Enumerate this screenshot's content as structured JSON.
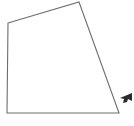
{
  "figure": {
    "name": "quadrilateral-outline-diagram",
    "background_color": "#ffffff",
    "stroke_color": "#6e6e6e",
    "fill_color": "#ffffff",
    "stroke_width": 1.1,
    "canvas": {
      "width": 134,
      "height": 126
    },
    "vertices": [
      {
        "label": "top-left",
        "x": 8,
        "y": 23
      },
      {
        "label": "top-right",
        "x": 79,
        "y": 2
      },
      {
        "label": "bottom-right",
        "x": 119,
        "y": 113
      },
      {
        "label": "bottom-left",
        "x": 7,
        "y": 113
      }
    ],
    "polygon_points": "8,23 79,2 119,113 7,113"
  },
  "cursor": {
    "name": "left-pointing-arrow-cursor",
    "color": "#2b2b2b",
    "x": 119,
    "y": 93,
    "width": 13,
    "height": 11,
    "points": "132,93 120,98 124,99 123,103 127,102 128,99 132,101"
  },
  "caption": {
    "text": "clipped caption",
    "visible_fragment": "",
    "color": "#8a8a8a",
    "clipped": "true"
  }
}
